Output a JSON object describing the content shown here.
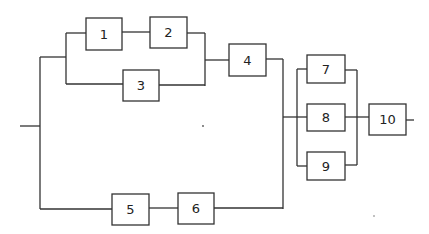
{
  "diagram": {
    "type": "reliability-block-diagram",
    "colors": {
      "line": "#333333",
      "box_fill": "#ffffff",
      "text": "#222222"
    },
    "blocks": [
      {
        "id": "1",
        "label": "1"
      },
      {
        "id": "2",
        "label": "2"
      },
      {
        "id": "3",
        "label": "3"
      },
      {
        "id": "4",
        "label": "4"
      },
      {
        "id": "5",
        "label": "5"
      },
      {
        "id": "6",
        "label": "6"
      },
      {
        "id": "7",
        "label": "7"
      },
      {
        "id": "8",
        "label": "8"
      },
      {
        "id": "9",
        "label": "9"
      },
      {
        "id": "10",
        "label": "10"
      }
    ],
    "structure": {
      "upper_branch": "((1 series 2) parallel 3) series 4",
      "lower_branch": "5 series 6",
      "middle_group": "7 parallel 8 parallel 9",
      "overall": "(upper_branch parallel lower_branch) series middle_group series 10"
    }
  }
}
